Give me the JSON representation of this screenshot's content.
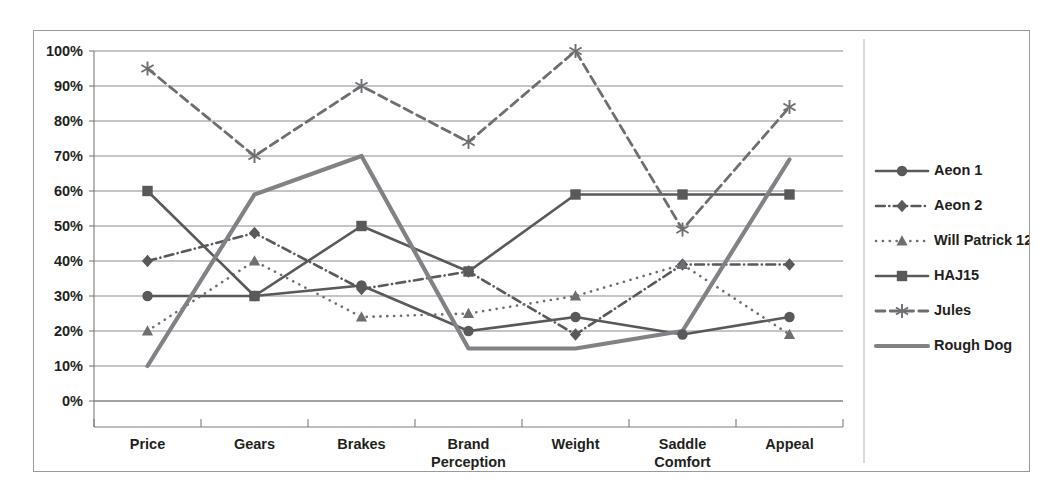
{
  "chart_data": {
    "type": "line",
    "title": "",
    "xlabel": "",
    "ylabel": "",
    "ylim": [
      0,
      100
    ],
    "yticks": [
      "0%",
      "10%",
      "20%",
      "30%",
      "40%",
      "50%",
      "60%",
      "70%",
      "80%",
      "90%",
      "100%"
    ],
    "ytick_values": [
      0,
      10,
      20,
      30,
      40,
      50,
      60,
      70,
      80,
      90,
      100
    ],
    "grid": true,
    "legend_position": "right",
    "categories": [
      "Price",
      "Gears",
      "Brakes",
      "Brand Perception",
      "Weight",
      "Saddle Comfort",
      "Appeal"
    ],
    "category_lines": [
      [
        "Price"
      ],
      [
        "Gears"
      ],
      [
        "Brakes"
      ],
      [
        "Brand",
        "Perception"
      ],
      [
        "Weight"
      ],
      [
        "Saddle",
        "Comfort"
      ],
      [
        "Appeal"
      ]
    ],
    "series": [
      {
        "name": "Aeon 1",
        "values": [
          30,
          30,
          33,
          20,
          24,
          19,
          24
        ],
        "color": "#58595b",
        "marker": "circle",
        "dash": "none",
        "width": 2.6
      },
      {
        "name": "Aeon 2",
        "values": [
          40,
          48,
          32,
          37,
          19,
          39,
          39
        ],
        "color": "#58595b",
        "marker": "diamond",
        "dash": "dashdot",
        "width": 2.6
      },
      {
        "name": "Will Patrick 12",
        "values": [
          20,
          40,
          24,
          25,
          30,
          39,
          19
        ],
        "color": "#6d6e71",
        "marker": "triangle",
        "dash": "dotted",
        "width": 2.6
      },
      {
        "name": "HAJ15",
        "values": [
          60,
          30,
          50,
          37,
          59,
          59,
          59
        ],
        "color": "#58595b",
        "marker": "square",
        "dash": "none",
        "width": 2.6
      },
      {
        "name": "Jules",
        "values": [
          95,
          70,
          90,
          74,
          100,
          49,
          84
        ],
        "color": "#6d6e71",
        "marker": "asterisk",
        "dash": "dashed",
        "width": 2.8
      },
      {
        "name": "Rough Dog",
        "values": [
          10,
          59,
          70,
          15,
          15,
          20,
          69
        ],
        "color": "#808285",
        "marker": "none",
        "dash": "none",
        "width": 4.2
      }
    ]
  },
  "legend": {
    "entries": [
      {
        "label": "Aeon 1"
      },
      {
        "label": "Aeon 2"
      },
      {
        "label": "Will Patrick 12"
      },
      {
        "label": "HAJ15"
      },
      {
        "label": "Jules"
      },
      {
        "label": "Rough Dog"
      }
    ]
  },
  "colors": {
    "border": "#9a9a9a",
    "gridline": "#8c8c8c",
    "axis": "#7d7d7d",
    "text": "#231f20",
    "background": "#ffffff"
  }
}
